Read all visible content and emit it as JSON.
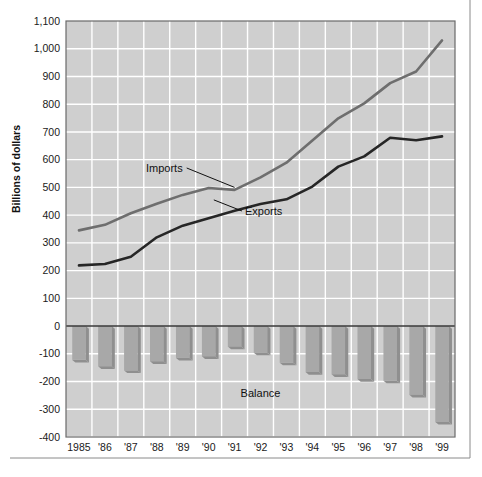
{
  "chart_data": {
    "type": "line",
    "title": "",
    "xlabel": "",
    "ylabel": "Billions of dollars",
    "ylim": [
      -400,
      1100
    ],
    "ytick_step": 100,
    "yticks": [
      "1,100",
      "1,000",
      "900",
      "800",
      "700",
      "600",
      "500",
      "400",
      "300",
      "200",
      "100",
      "0",
      "-100",
      "-200",
      "-300",
      "-400"
    ],
    "ytick_values": [
      1100,
      1000,
      900,
      800,
      700,
      600,
      500,
      400,
      300,
      200,
      100,
      0,
      -100,
      -200,
      -300,
      -400
    ],
    "grid": true,
    "grid_color": "#ffffff",
    "plot_background": "#cfcfcf",
    "legend_position": "inline-annotations",
    "categories": [
      "1985",
      "'86",
      "'87",
      "'88",
      "'89",
      "'90",
      "'91",
      "'92",
      "'93",
      "'94",
      "'95",
      "'96",
      "'97",
      "'98",
      "'99"
    ],
    "x": [
      1985,
      1986,
      1987,
      1988,
      1989,
      1990,
      1991,
      1992,
      1993,
      1994,
      1995,
      1996,
      1997,
      1998,
      1999
    ],
    "series": [
      {
        "name": "Imports",
        "render": "line",
        "color": "#6e6e6e",
        "values": [
          345,
          365,
          407,
          441,
          473,
          498,
          491,
          536,
          589,
          669,
          749,
          803,
          876,
          918,
          1030
        ]
      },
      {
        "name": "Exports",
        "render": "line",
        "color": "#262626",
        "values": [
          219,
          224,
          250,
          320,
          362,
          389,
          416,
          440,
          457,
          503,
          575,
          612,
          679,
          670,
          684
        ]
      },
      {
        "name": "Balance",
        "render": "bar",
        "color": "#a8a8a8",
        "values": [
          -122,
          -145,
          -160,
          -127,
          -115,
          -109,
          -74,
          -96,
          -132,
          -166,
          -174,
          -191,
          -197,
          -248,
          -346
        ]
      }
    ],
    "annotations": [
      {
        "text": "Imports",
        "name": "imports-label",
        "x": 1989.0,
        "y": 570,
        "leader_to_x": 1991.0,
        "leader_to_y": 500
      },
      {
        "text": "Exports",
        "name": "exports-label",
        "x": 1991.4,
        "y": 415,
        "leader_to_x": 1990.2,
        "leader_to_y": 455
      },
      {
        "text": "Balance",
        "name": "balance-label",
        "x": 1992.0,
        "y": -243
      }
    ]
  }
}
